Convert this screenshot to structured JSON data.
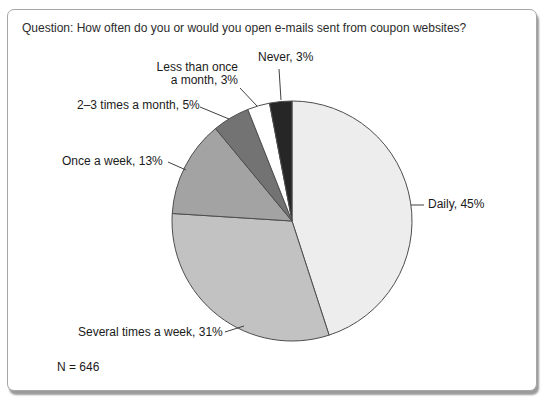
{
  "chart_data": {
    "type": "pie",
    "title": "Question: How often do you or would you open e-mails sent from coupon websites?",
    "sample_size_label": "N = 646",
    "categories": [
      "Daily",
      "Several times a week",
      "Once a week",
      "2–3 times a month",
      "Less than once a month",
      "Never"
    ],
    "values": [
      45,
      31,
      13,
      5,
      3,
      3
    ],
    "value_unit": "%",
    "start_angle_deg": 0,
    "direction": "clockwise",
    "legend_position": "none",
    "grid": false,
    "colors": [
      "#ededed",
      "#c2c2c2",
      "#a3a3a3",
      "#737373",
      "#ffffff",
      "#262626"
    ],
    "slice_stroke_color": "#4d4d4d",
    "leader_line_color": "#404040",
    "slice_labels": {
      "never": "Never, 3%",
      "less_than_once_a_month": "Less than once\na month, 3%",
      "two_three_times_a_month": "2–3 times a month, 5%",
      "once_a_week": "Once a week, 13%",
      "daily": "Daily, 45%",
      "several_times_a_week": "Several times a week, 31%"
    }
  }
}
